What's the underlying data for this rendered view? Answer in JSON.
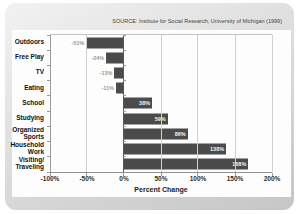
{
  "source_note": "SOURCE: Institute for Social Research, University of Michigan (1999)",
  "chart_data": {
    "type": "bar",
    "orientation": "horizontal",
    "title": "",
    "xlabel": "Percent Change",
    "xlim": [
      -100,
      200
    ],
    "x_ticks": [
      "-100%",
      "-50%",
      "0%",
      "50%",
      "100%",
      "150%",
      "200%"
    ],
    "grid": "vertical",
    "categories": [
      "Outdoors",
      "Free Play",
      "TV",
      "Eating",
      "School",
      "Studying",
      "Organized\nSports",
      "Household\nWork",
      "Visiting/\nTraveling"
    ],
    "values": [
      -51,
      -24,
      -13,
      -11,
      38,
      59,
      86,
      138,
      168
    ],
    "value_labels": [
      "-51%",
      "-24%",
      "-13%",
      "-11%",
      "38%",
      "59%",
      "86%",
      "138%",
      "168%"
    ],
    "bar_color": "#4b4b4b",
    "positive_label_color": "#f5f5f5",
    "negative_label_color": "#9a9a9a"
  }
}
